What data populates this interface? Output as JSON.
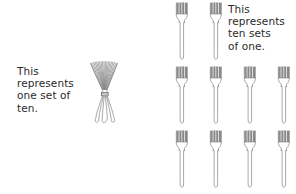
{
  "canvas": {
    "width": 296,
    "height": 194,
    "background": "#ffffff"
  },
  "colors": {
    "background": "#ffffff",
    "text": "#2b2b2b",
    "fork_outline": "#6e6e6e",
    "fork_tine_fill": "#8a8a8a",
    "fork_body_fill": "#fdfdfd"
  },
  "captions": {
    "left": {
      "lines": [
        "This",
        "represents",
        "one set of",
        "ten."
      ],
      "text": "This\nrepresents\none set of\nten."
    },
    "right": {
      "lines": [
        "This",
        "represents",
        "ten sets",
        "of one."
      ],
      "text": "This\nrepresents\nten sets\nof one."
    }
  },
  "bundle": {
    "label": "bundle-of-ten-forks",
    "count": 10,
    "tied": true,
    "position": {
      "x": 86,
      "y": 60
    }
  },
  "fork_grid": {
    "label": "ten-single-forks",
    "total": 10,
    "columns_x": [
      171,
      205,
      239,
      273
    ],
    "rows_y": [
      1,
      65,
      129
    ],
    "rows": [
      {
        "row": 1,
        "count": 2,
        "columns": [
          0,
          1
        ]
      },
      {
        "row": 2,
        "count": 4,
        "columns": [
          0,
          1,
          2,
          3
        ]
      },
      {
        "row": 3,
        "count": 4,
        "columns": [
          0,
          1,
          2,
          3
        ]
      }
    ]
  }
}
